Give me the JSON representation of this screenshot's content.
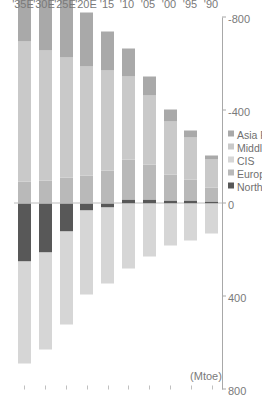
{
  "chart_data": {
    "type": "bar",
    "orientation": "horizontal-stacked",
    "title": "",
    "subtitle": "",
    "xlabel": "(Mtoe)",
    "ylabel": "",
    "units": "(Mtoe)",
    "xlim": [
      800,
      -800
    ],
    "xticks": [
      800,
      400,
      0,
      -400,
      -800
    ],
    "xtick_labels": [
      "800",
      "400",
      "0",
      "-400",
      "-800"
    ],
    "grid": false,
    "legend_position": "bottom-left",
    "categories": [
      "'90",
      "'95",
      "'00",
      "'05",
      "'10",
      "'15",
      "'20E",
      "'25E",
      "'30E",
      "'35E"
    ],
    "series": [
      {
        "name": "North America",
        "color": "#585858",
        "values": [
          -8,
          -12,
          -14,
          -16,
          -18,
          16,
          30,
          120,
          210,
          250
        ]
      },
      {
        "name": "Europe",
        "color": "#b9b9b9",
        "values": [
          -60,
          -90,
          -110,
          -150,
          -170,
          -140,
          -120,
          -110,
          -100,
          -95
        ]
      },
      {
        "name": "CIS",
        "color": "#d6d6d6",
        "values": [
          130,
          160,
          180,
          230,
          280,
          330,
          360,
          400,
          420,
          440
        ]
      },
      {
        "name": "Middle East",
        "color": "#c9c9c9",
        "values": [
          -120,
          -180,
          -230,
          -300,
          -360,
          -430,
          -470,
          -520,
          -560,
          -600
        ]
      },
      {
        "name": "Asia Pacific",
        "color": "#a9a9a9",
        "values": [
          -20,
          -30,
          -50,
          -80,
          -120,
          -170,
          -230,
          -330,
          -430,
          -520
        ]
      }
    ]
  },
  "axis": {
    "units_label": "(Mtoe)",
    "value_ticks": [
      "800",
      "400",
      "0",
      "-400",
      "-800"
    ],
    "category_ticks": [
      "'90",
      "'95",
      "'00",
      "'05",
      "'10",
      "'15",
      "'20E",
      "'25E",
      "'30E",
      "'35E"
    ]
  },
  "legend": {
    "items": [
      {
        "label": "North America",
        "color": "#585858"
      },
      {
        "label": "Europe",
        "color": "#b9b9b9"
      },
      {
        "label": "CIS",
        "color": "#d6d6d6"
      },
      {
        "label": "Middle East",
        "color": "#c9c9c9"
      },
      {
        "label": "Asia Pacific",
        "color": "#a9a9a9"
      }
    ]
  },
  "colors": {
    "axis_line": "#a8a8a8",
    "zero_line": "#bdbdbd",
    "tick_label": "#7a7a7a",
    "background": "#ffffff"
  }
}
